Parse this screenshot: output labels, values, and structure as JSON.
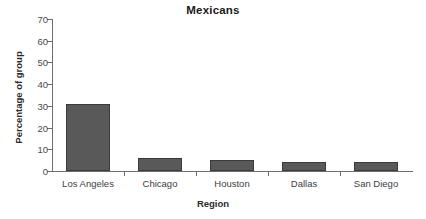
{
  "chart_data": {
    "type": "bar",
    "title": "Mexicans",
    "xlabel": "Region",
    "ylabel": "Percentage of group",
    "categories": [
      "Los Angeles",
      "Chicago",
      "Houston",
      "Dallas",
      "San  Diego"
    ],
    "values": [
      31,
      6,
      5,
      4,
      4
    ],
    "ylim": [
      0,
      70
    ],
    "yticks": [
      0,
      10,
      20,
      30,
      40,
      50,
      60,
      70
    ],
    "ytick_labels": [
      "0",
      "10",
      "20",
      "30",
      "40",
      "50",
      "60",
      "70"
    ],
    "grid": false,
    "legend": false,
    "bar_color": "#595959",
    "bar_edge_color": "#3a3a3a",
    "axis_color": "#6e6e6e",
    "background": "#ffffff"
  }
}
